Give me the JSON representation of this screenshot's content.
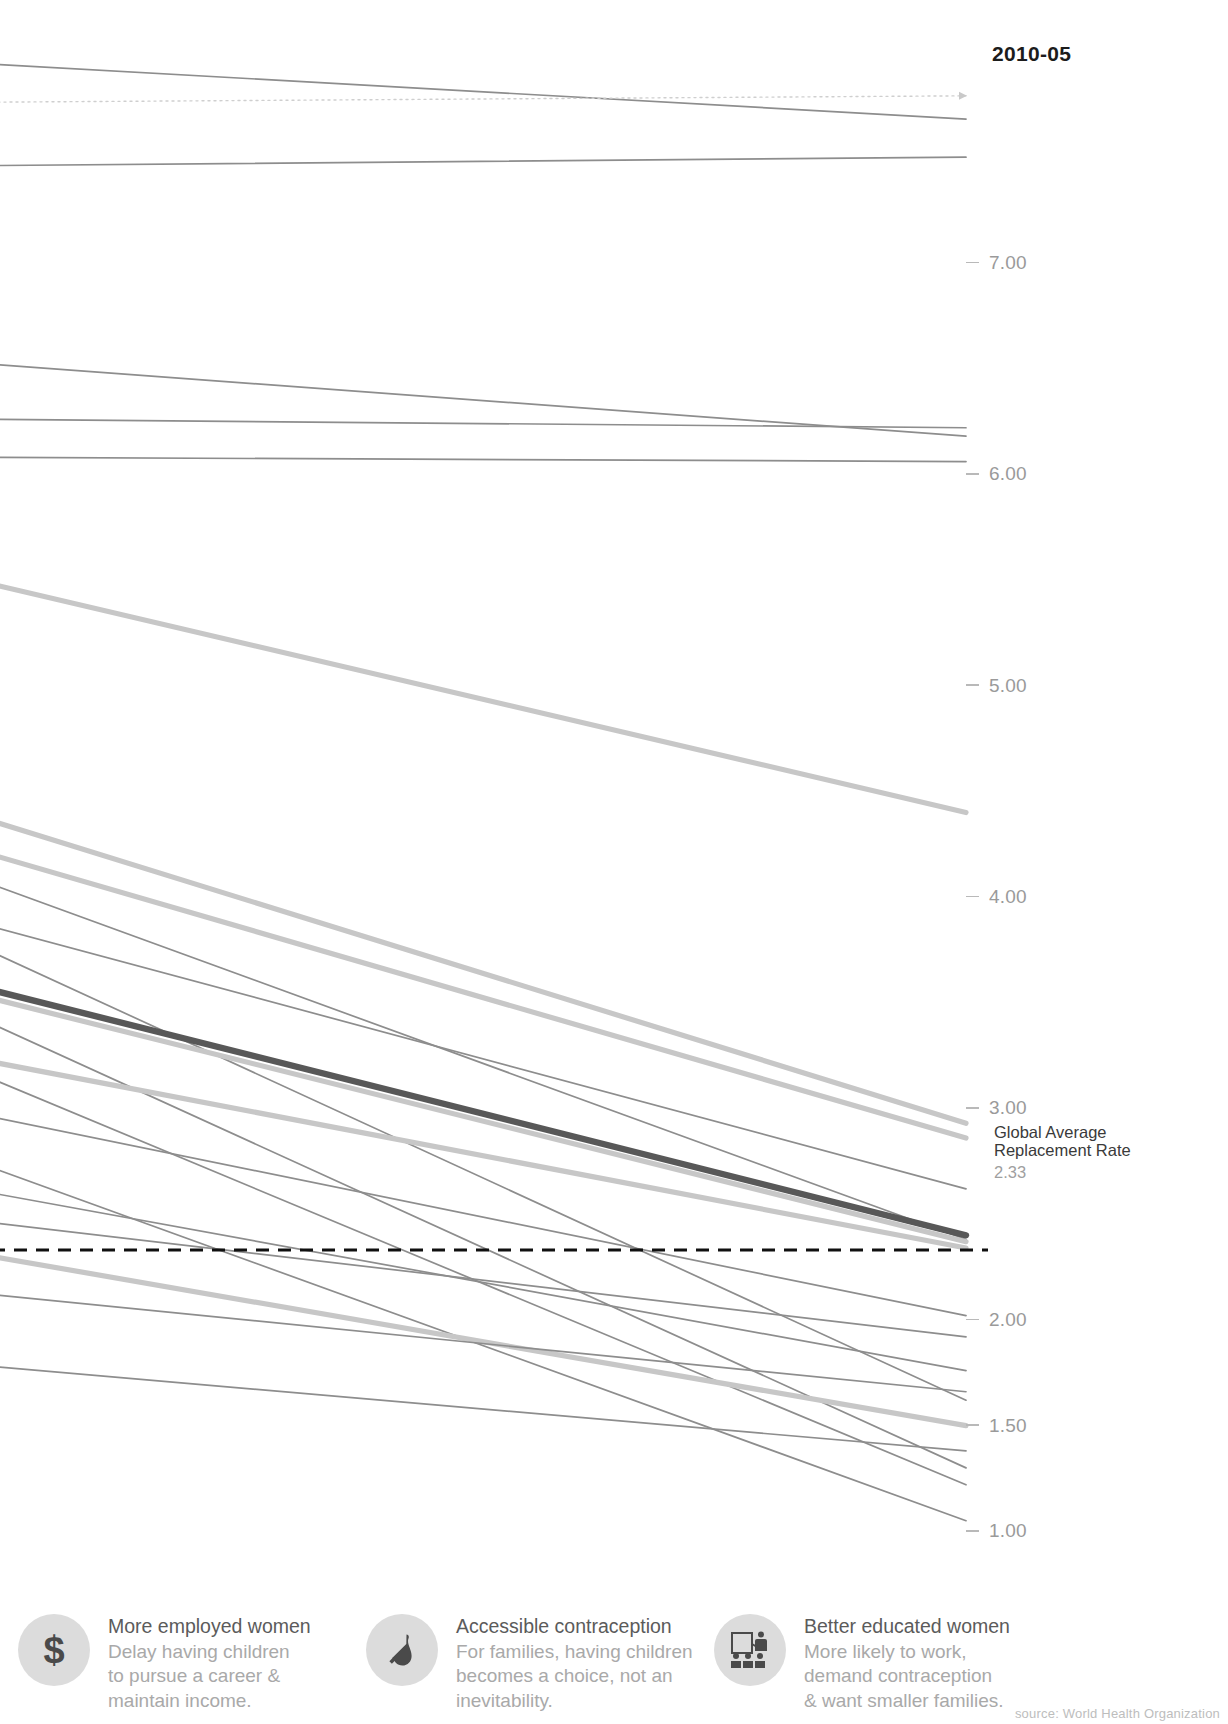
{
  "header": {
    "column_label": "2010-05"
  },
  "axis": {
    "ticks": [
      {
        "label": "7.00",
        "value": 7.0
      },
      {
        "label": "6.00",
        "value": 6.0
      },
      {
        "label": "5.00",
        "value": 5.0
      },
      {
        "label": "4.00",
        "value": 4.0
      },
      {
        "label": "3.00",
        "value": 3.0
      },
      {
        "label": "2.00",
        "value": 2.0
      },
      {
        "label": "1.50",
        "value": 1.5
      },
      {
        "label": "1.00",
        "value": 1.0
      }
    ]
  },
  "reference_line": {
    "title_line1": "Global Average",
    "title_line2": "Replacement Rate",
    "value_label": "2.33",
    "value": 2.33,
    "style": "dashed",
    "color": "#101010"
  },
  "colors": {
    "thin_line": "#8d8d8d",
    "thick_line": "#c7c7c7",
    "highlight_line": "#585858",
    "tick_text": "#9a9a9a",
    "header_text": "#1c1c1c",
    "icon_bg": "#dcdcdc",
    "footer_title": "#5b5b5b",
    "footer_body": "#a9a9a9"
  },
  "footer": {
    "cards": [
      {
        "icon": "dollar-sign-icon",
        "glyph": "$",
        "title": "More employed women",
        "desc": "Delay having children\nto pursue a career &\nmaintain income."
      },
      {
        "icon": "condom-icon",
        "glyph": "",
        "title": "Accessible contraception",
        "desc": "For families, having children\nbecomes a choice, not an\ninevitability."
      },
      {
        "icon": "classroom-education-icon",
        "glyph": "",
        "title": "Better educated women",
        "desc": "More likely to work,\ndemand contraception\n& want smaller families."
      }
    ],
    "source": "source: World Health Organization"
  },
  "chart_data": {
    "type": "line",
    "title": "",
    "subtitle": "",
    "xlabel": "",
    "ylabel": "Total Fertility Rate (children per woman)",
    "x": [
      "start",
      "2010-05"
    ],
    "xlim": [
      0,
      1
    ],
    "ylim": [
      0.85,
      7.95
    ],
    "grid": false,
    "legend": "none",
    "axis_side": "right",
    "annotations": [
      {
        "text": "Global Average Replacement Rate",
        "value": 2.33,
        "style": "dashed-horizontal"
      },
      {
        "text": "2010-05",
        "position": "top-right"
      }
    ],
    "series": [
      {
        "name": "s01",
        "values": [
          7.94,
          7.68
        ],
        "weight": "thin",
        "color": "#8d8d8d"
      },
      {
        "name": "s02",
        "values": [
          7.76,
          7.79
        ],
        "weight": "thin",
        "color": "#cfcfcf",
        "style": "dotted"
      },
      {
        "name": "s03",
        "values": [
          7.46,
          7.5
        ],
        "weight": "thin",
        "color": "#8d8d8d"
      },
      {
        "name": "s04",
        "values": [
          6.52,
          6.18
        ],
        "weight": "thin",
        "color": "#8d8d8d"
      },
      {
        "name": "s05",
        "values": [
          6.26,
          6.22
        ],
        "weight": "thin",
        "color": "#8d8d8d"
      },
      {
        "name": "s06",
        "values": [
          6.08,
          6.06
        ],
        "weight": "thin",
        "color": "#8d8d8d"
      },
      {
        "name": "s07",
        "values": [
          5.48,
          4.4
        ],
        "weight": "thick",
        "color": "#c7c7c7"
      },
      {
        "name": "s08",
        "values": [
          4.36,
          2.93
        ],
        "weight": "thick",
        "color": "#c7c7c7"
      },
      {
        "name": "s09",
        "values": [
          4.2,
          2.86
        ],
        "weight": "thick",
        "color": "#c7c7c7"
      },
      {
        "name": "s10",
        "values": [
          4.06,
          2.38
        ],
        "weight": "thin",
        "color": "#8d8d8d"
      },
      {
        "name": "s11",
        "values": [
          3.86,
          2.62
        ],
        "weight": "thin",
        "color": "#8d8d8d"
      },
      {
        "name": "s12",
        "values": [
          3.74,
          1.62
        ],
        "weight": "thin",
        "color": "#8d8d8d"
      },
      {
        "name": "s13",
        "values": [
          3.56,
          2.4
        ],
        "weight": "highlight",
        "color": "#585858"
      },
      {
        "name": "s14",
        "values": [
          3.52,
          2.37
        ],
        "weight": "thick",
        "color": "#c7c7c7"
      },
      {
        "name": "s15",
        "values": [
          3.4,
          1.3
        ],
        "weight": "thin",
        "color": "#8d8d8d"
      },
      {
        "name": "s16",
        "values": [
          3.22,
          2.34
        ],
        "weight": "thick",
        "color": "#c7c7c7"
      },
      {
        "name": "s17",
        "values": [
          3.14,
          1.22
        ],
        "weight": "thin",
        "color": "#8d8d8d"
      },
      {
        "name": "s18",
        "values": [
          2.96,
          2.02
        ],
        "weight": "thin",
        "color": "#8d8d8d"
      },
      {
        "name": "s19",
        "values": [
          2.72,
          1.05
        ],
        "weight": "thin",
        "color": "#8d8d8d"
      },
      {
        "name": "s20",
        "values": [
          2.6,
          1.76
        ],
        "weight": "thin",
        "color": "#8d8d8d"
      },
      {
        "name": "s21",
        "values": [
          2.46,
          1.92
        ],
        "weight": "thin",
        "color": "#8d8d8d"
      },
      {
        "name": "s22",
        "values": [
          2.3,
          1.5
        ],
        "weight": "thick",
        "color": "#c7c7c7"
      },
      {
        "name": "s23",
        "values": [
          2.12,
          1.66
        ],
        "weight": "thin",
        "color": "#8d8d8d"
      },
      {
        "name": "s24",
        "values": [
          1.78,
          1.38
        ],
        "weight": "thin",
        "color": "#8d8d8d"
      }
    ]
  }
}
